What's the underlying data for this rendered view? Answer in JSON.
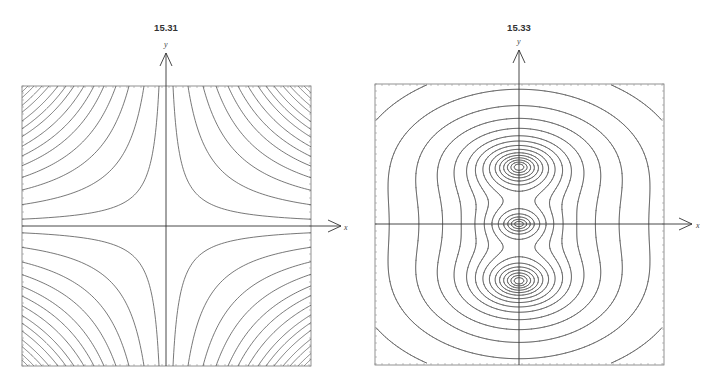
{
  "figure": {
    "background": "#ffffff",
    "line_color": "#555555",
    "axis_color": "#333333"
  },
  "chart_data": [
    {
      "type": "contour",
      "title": "15.31",
      "xlabel": "x",
      "ylabel": "y",
      "function": "x*y",
      "description": "Level curves of f(x,y) = xy: rectangular hyperbolas in all four quadrants, symmetric about both axes",
      "frame": {
        "left": 22,
        "top": 86,
        "right": 311,
        "bottom": 366
      },
      "origin_px": [
        166,
        226
      ],
      "x_axis": {
        "x0": 22,
        "x1": 341,
        "label_x": 344,
        "label_y": 229
      },
      "y_axis": {
        "y0": 366,
        "y1": 53,
        "label_x": 164,
        "label_y": 48
      },
      "title_pos": [
        166,
        28
      ],
      "levels_top_edge_crossing_px": [
        7,
        22,
        37,
        50,
        62,
        72,
        82,
        92,
        100,
        108,
        117,
        124,
        132,
        138
      ],
      "grid": false,
      "legend": null
    },
    {
      "type": "contour",
      "title": "15.33",
      "xlabel": "x",
      "ylabel": "y",
      "description": "Level curves of a field with two large lobes on the y-axis (above and below the origin) and a small central lobe at the origin, with a figure-eight separatrix crossing the x-axis and enclosing nested oval outer contours",
      "frame": {
        "left": 375,
        "top": 84,
        "right": 664,
        "bottom": 365
      },
      "origin_px": [
        519,
        224
      ],
      "x_axis": {
        "x0": 375,
        "x1": 692,
        "label_x": 696,
        "label_y": 227
      },
      "y_axis": {
        "y0": 365,
        "y1": 50,
        "label_x": 517,
        "label_y": 45
      },
      "title_pos": [
        519,
        28
      ],
      "field": {
        "unit_px": 57,
        "lobes": [
          {
            "cx": 0,
            "cy": 1,
            "ax": 0.95,
            "ay": 0.6,
            "w": 1.0
          },
          {
            "cx": 0,
            "cy": -1,
            "ax": 0.95,
            "ay": 0.6,
            "w": 1.0
          },
          {
            "cx": 0,
            "cy": 0,
            "ax": 0.55,
            "ay": 0.32,
            "w": 0.62
          }
        ],
        "levels": [
          0.035,
          0.075,
          0.13,
          0.2,
          0.28,
          0.36,
          0.43,
          0.5,
          0.57,
          0.64,
          0.7,
          0.76,
          0.82,
          0.88,
          0.94
        ]
      },
      "lobe_centers_px": [
        [
          519,
          168
        ],
        [
          519,
          224
        ],
        [
          519,
          281
        ]
      ],
      "separatrix_x_crossings_px": [
        461,
        577
      ],
      "outer_contour_x_crossings_px": [
        402,
        422,
        437,
        601,
        616,
        636
      ],
      "grid": false,
      "legend": null
    }
  ]
}
